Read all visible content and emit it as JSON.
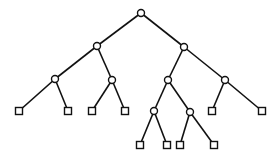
{
  "diagram": {
    "type": "tree",
    "colors": {
      "stroke": "#111111",
      "fill": "#ffffff",
      "background": "#ffffff"
    },
    "inner_radius": 3.5,
    "leaf_size": 7,
    "nodes": [
      {
        "id": "n0",
        "kind": "inner",
        "x": 141,
        "y": 13
      },
      {
        "id": "n1",
        "kind": "inner",
        "x": 97,
        "y": 46
      },
      {
        "id": "n2",
        "kind": "inner",
        "x": 184,
        "y": 47
      },
      {
        "id": "n3",
        "kind": "inner",
        "x": 55,
        "y": 79
      },
      {
        "id": "n4",
        "kind": "inner",
        "x": 112,
        "y": 80
      },
      {
        "id": "n5",
        "kind": "inner",
        "x": 168,
        "y": 80
      },
      {
        "id": "n6",
        "kind": "inner",
        "x": 225,
        "y": 80
      },
      {
        "id": "l0",
        "kind": "leaf",
        "x": 19,
        "y": 111
      },
      {
        "id": "l1",
        "kind": "leaf",
        "x": 68,
        "y": 111
      },
      {
        "id": "l2",
        "kind": "leaf",
        "x": 92,
        "y": 111
      },
      {
        "id": "l3",
        "kind": "leaf",
        "x": 125,
        "y": 111
      },
      {
        "id": "n7",
        "kind": "inner",
        "x": 154,
        "y": 111
      },
      {
        "id": "n8",
        "kind": "inner",
        "x": 190,
        "y": 112
      },
      {
        "id": "l4",
        "kind": "leaf",
        "x": 212,
        "y": 111
      },
      {
        "id": "l5",
        "kind": "leaf",
        "x": 262,
        "y": 111
      },
      {
        "id": "l6",
        "kind": "leaf",
        "x": 140,
        "y": 145
      },
      {
        "id": "l7",
        "kind": "leaf",
        "x": 167,
        "y": 145
      },
      {
        "id": "l8",
        "kind": "leaf",
        "x": 180,
        "y": 145
      },
      {
        "id": "l9",
        "kind": "leaf",
        "x": 214,
        "y": 145
      }
    ],
    "edges": [
      [
        "n0",
        "n1"
      ],
      [
        "n0",
        "n2"
      ],
      [
        "n1",
        "n3"
      ],
      [
        "n1",
        "n4"
      ],
      [
        "n2",
        "n5"
      ],
      [
        "n2",
        "n6"
      ],
      [
        "n3",
        "l0"
      ],
      [
        "n3",
        "l1"
      ],
      [
        "n4",
        "l2"
      ],
      [
        "n4",
        "l3"
      ],
      [
        "n5",
        "n7"
      ],
      [
        "n5",
        "n8"
      ],
      [
        "n6",
        "l4"
      ],
      [
        "n6",
        "l5"
      ],
      [
        "n7",
        "l6"
      ],
      [
        "n7",
        "l7"
      ],
      [
        "n8",
        "l8"
      ],
      [
        "n8",
        "l9"
      ]
    ]
  }
}
